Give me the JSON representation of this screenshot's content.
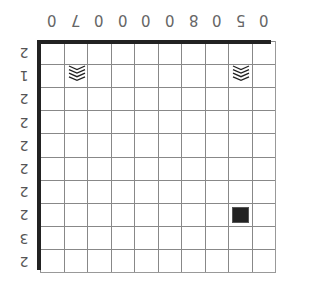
{
  "puzzle": {
    "type": "nonogram",
    "rows": 10,
    "cols": 10,
    "orientation": "rotated-180",
    "column_clues": [
      "0",
      "7",
      "0",
      "0",
      "0",
      "0",
      "8",
      "0",
      "5",
      "0"
    ],
    "row_clues": [
      "2",
      "1",
      "2",
      "2",
      "2",
      "2",
      "2",
      "2",
      "3",
      "2"
    ],
    "cells": [
      {
        "row": 1,
        "col": 1,
        "state": "chevron-mark"
      },
      {
        "row": 1,
        "col": 8,
        "state": "chevron-mark"
      },
      {
        "row": 7,
        "col": 8,
        "state": "filled"
      }
    ],
    "colors": {
      "filled": "#222222",
      "grid_line": "#888888",
      "thick_border": "#222222",
      "clue_text": "#666666"
    }
  }
}
